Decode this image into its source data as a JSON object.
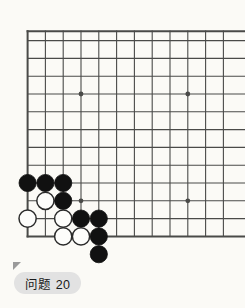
{
  "page": {
    "background_color": "#ffffff",
    "board_background_color": "#fbfaf6",
    "line_color": "#4a4a48",
    "black_stone_color": "#111111",
    "white_stone_color": "#fdfdfb",
    "white_stone_edge_color": "#2b2b2b"
  },
  "label": {
    "text": "问题 20",
    "chip_color": "#e2e2e2",
    "marker_icon": "corner-triangle-icon"
  },
  "board": {
    "type": "go-board-corner-diagram",
    "orientation": "lower-left-corner",
    "origin_x": 27.6,
    "origin_y": 40.6,
    "spacing": 17.8,
    "cols": 12,
    "rows": 12,
    "edge_left_col": 0,
    "edge_bottom_row": 11,
    "star_points": [
      {
        "col": 3,
        "row": 3
      },
      {
        "col": 9,
        "row": 3
      },
      {
        "col": 3,
        "row": 9
      },
      {
        "col": 9,
        "row": 9
      }
    ],
    "stones": [
      {
        "color": "black",
        "col": 0,
        "row": 8
      },
      {
        "color": "black",
        "col": 1,
        "row": 8
      },
      {
        "color": "black",
        "col": 2,
        "row": 8
      },
      {
        "color": "white",
        "col": 1,
        "row": 9
      },
      {
        "color": "black",
        "col": 2,
        "row": 9
      },
      {
        "color": "white",
        "col": 0,
        "row": 10
      },
      {
        "color": "white",
        "col": 2,
        "row": 10
      },
      {
        "color": "black",
        "col": 3,
        "row": 10
      },
      {
        "color": "black",
        "col": 4,
        "row": 10
      },
      {
        "color": "white",
        "col": 2,
        "row": 11
      },
      {
        "color": "white",
        "col": 3,
        "row": 11
      },
      {
        "color": "black",
        "col": 4,
        "row": 11
      },
      {
        "color": "black",
        "col": 4,
        "row": 12
      }
    ],
    "stone_radius": 8.6,
    "counts": {
      "black": 8,
      "white": 5
    }
  }
}
